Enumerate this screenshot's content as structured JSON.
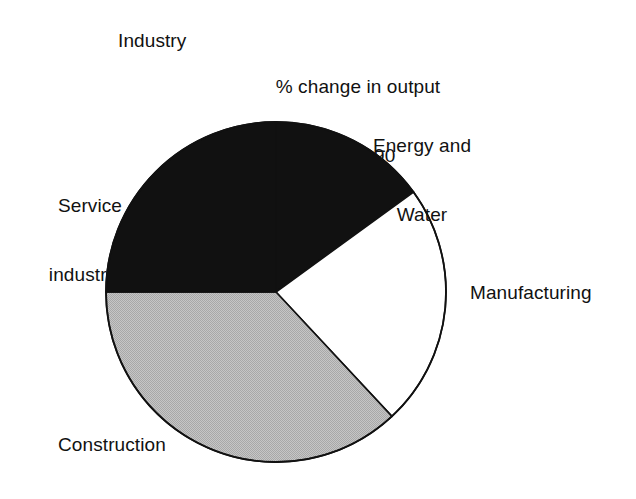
{
  "chart_data": {
    "type": "pie",
    "title": "% change in output",
    "subtitle": "1985–90",
    "axis_caption": "Industry",
    "xlabel": "",
    "ylabel": "",
    "legend_position": "none",
    "grid": false,
    "start_angle_deg": 0,
    "direction": "clockwise",
    "categories": [
      "Energy and Water",
      "Manufacturing",
      "Construction",
      "Service industries"
    ],
    "values": [
      15,
      23,
      37,
      25
    ],
    "slices": [
      {
        "label": "Energy and Water",
        "label_line1": "Energy and",
        "label_line2": "Water",
        "value": 15,
        "start_deg": 0,
        "end_deg": 54,
        "fill": "#111111",
        "stroke": "#111111",
        "fill_style": "solid-black"
      },
      {
        "label": "Manufacturing",
        "label_line1": "Manufacturing",
        "label_line2": "",
        "value": 23,
        "start_deg": 54,
        "end_deg": 137,
        "fill": "#ffffff",
        "stroke": "#111111",
        "fill_style": "white"
      },
      {
        "label": "Construction",
        "label_line1": "Construction",
        "label_line2": "",
        "value": 37,
        "start_deg": 137,
        "end_deg": 270,
        "fill": "#bcbcbc",
        "stroke": "#111111",
        "fill_style": "dithered-grey"
      },
      {
        "label": "Service industries",
        "label_line1": "Service",
        "label_line2": "industries",
        "value": 25,
        "start_deg": 270,
        "end_deg": 360,
        "fill": "#111111",
        "stroke": "#111111",
        "fill_style": "solid-black"
      }
    ],
    "geometry": {
      "center_x": 276,
      "center_y": 292,
      "radius": 170
    },
    "colors": {
      "background": "#ffffff",
      "text": "#111111",
      "outline": "#111111",
      "black_slice": "#111111",
      "grey_slice": "#bcbcbc",
      "white_slice": "#ffffff"
    }
  }
}
